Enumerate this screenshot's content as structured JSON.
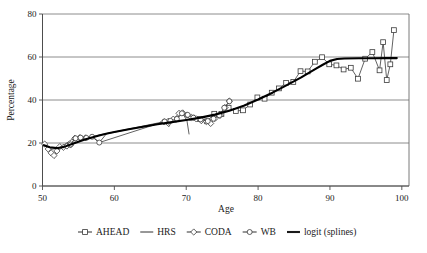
{
  "chart_data": {
    "type": "line",
    "title": "",
    "xlabel": "Age",
    "ylabel": "Percentage",
    "xlim": [
      50,
      101
    ],
    "ylim": [
      0,
      80
    ],
    "xticks": [
      50,
      60,
      70,
      80,
      90,
      100
    ],
    "yticks": [
      0,
      20,
      40,
      60,
      80
    ],
    "grid": "horizontal",
    "legend_position": "bottom-outside",
    "legend": [
      "AHEAD",
      "HRS",
      "CODA",
      "WB",
      "logit (splines)"
    ],
    "series": [
      {
        "name": "AHEAD",
        "marker": "square",
        "points": [
          [
            70.8,
            31.8
          ],
          [
            71.9,
            31.2
          ],
          [
            72.9,
            30.1
          ],
          [
            73.9,
            33.6
          ],
          [
            74.9,
            33.5
          ],
          [
            75.9,
            36.4
          ],
          [
            76.9,
            34.9
          ],
          [
            77.9,
            35.2
          ],
          [
            78.9,
            37.9
          ],
          [
            79.9,
            41.2
          ],
          [
            80.9,
            40.6
          ],
          [
            81.9,
            43.4
          ],
          [
            82.9,
            45.4
          ],
          [
            83.9,
            48.0
          ],
          [
            84.9,
            48.4
          ],
          [
            85.9,
            53.4
          ],
          [
            86.9,
            53.3
          ],
          [
            87.9,
            57.8
          ],
          [
            88.9,
            59.9
          ],
          [
            89.9,
            56.6
          ],
          [
            90.9,
            56.1
          ],
          [
            91.9,
            54.2
          ],
          [
            92.9,
            55.0
          ],
          [
            93.9,
            49.9
          ],
          [
            94.9,
            59.2
          ],
          [
            95.9,
            62.3
          ],
          [
            96.9,
            53.8
          ],
          [
            97.4,
            66.9
          ],
          [
            97.9,
            49.3
          ],
          [
            98.4,
            56.6
          ],
          [
            98.9,
            72.5
          ]
        ]
      },
      {
        "name": "HRS",
        "marker": "none",
        "points": [
          [
            50.3,
            19.8
          ],
          [
            51.2,
            17.0
          ],
          [
            52.1,
            17.6
          ],
          [
            53.0,
            19.1
          ],
          [
            54.0,
            21.5
          ],
          [
            55.0,
            22.0
          ],
          [
            56.0,
            22.4
          ],
          [
            57.0,
            23.0
          ],
          [
            57.9,
            20.2
          ],
          [
            58.9,
            24.3
          ],
          [
            66.9,
            29.6
          ],
          [
            67.6,
            27.6
          ],
          [
            68.1,
            30.9
          ],
          [
            68.6,
            29.6
          ],
          [
            69.1,
            33.6
          ],
          [
            69.6,
            33.2
          ],
          [
            70.1,
            30.4
          ],
          [
            70.4,
            24.0
          ]
        ]
      },
      {
        "name": "CODA",
        "marker": "diamond",
        "points": [
          [
            50.3,
            19.5
          ],
          [
            50.8,
            17.2
          ],
          [
            51.2,
            15.4
          ],
          [
            51.6,
            14.2
          ],
          [
            52.0,
            16.3
          ],
          [
            52.4,
            18.3
          ],
          [
            52.9,
            18.0
          ],
          [
            53.4,
            18.6
          ],
          [
            53.9,
            19.1
          ],
          [
            54.5,
            22.2
          ],
          [
            55.2,
            22.5
          ],
          [
            56.0,
            22.4
          ],
          [
            66.9,
            29.9
          ],
          [
            67.5,
            30.1
          ],
          [
            68.2,
            31.1
          ],
          [
            69.0,
            33.8
          ],
          [
            69.5,
            34.0
          ],
          [
            70.1,
            33.0
          ],
          [
            70.7,
            31.9
          ],
          [
            71.4,
            31.2
          ],
          [
            72.1,
            30.4
          ],
          [
            72.8,
            30.0
          ],
          [
            73.4,
            29.1
          ],
          [
            74.0,
            31.4
          ],
          [
            74.7,
            32.8
          ],
          [
            75.4,
            36.5
          ],
          [
            76.0,
            39.5
          ]
        ]
      },
      {
        "name": "WB",
        "marker": "circle",
        "points": [
          [
            53.9,
            19.3
          ],
          [
            54.6,
            22.2
          ],
          [
            55.3,
            22.5
          ],
          [
            56.1,
            22.4
          ],
          [
            56.9,
            22.9
          ],
          [
            57.9,
            20.2
          ],
          [
            67.0,
            30.0
          ],
          [
            67.8,
            30.3
          ],
          [
            68.7,
            31.2
          ],
          [
            69.4,
            33.8
          ],
          [
            70.2,
            33.1
          ],
          [
            71.0,
            31.8
          ],
          [
            72.0,
            31.0
          ],
          [
            73.0,
            30.2
          ],
          [
            73.8,
            31.3
          ],
          [
            74.6,
            32.9
          ],
          [
            75.3,
            36.4
          ],
          [
            76.0,
            39.4
          ]
        ]
      },
      {
        "name": "logit (splines)",
        "marker": "none",
        "points": [
          [
            50.2,
            19.0
          ],
          [
            51.0,
            18.0
          ],
          [
            52.0,
            17.6
          ],
          [
            53.0,
            18.2
          ],
          [
            54.0,
            19.4
          ],
          [
            55.0,
            20.6
          ],
          [
            56.0,
            21.7
          ],
          [
            57.0,
            22.7
          ],
          [
            58.0,
            23.6
          ],
          [
            59.0,
            24.4
          ],
          [
            60.0,
            25.1
          ],
          [
            62.0,
            26.4
          ],
          [
            64.0,
            27.6
          ],
          [
            66.0,
            28.7
          ],
          [
            68.0,
            29.7
          ],
          [
            70.0,
            30.7
          ],
          [
            72.0,
            31.8
          ],
          [
            74.0,
            33.2
          ],
          [
            76.0,
            35.0
          ],
          [
            78.0,
            37.3
          ],
          [
            80.0,
            40.2
          ],
          [
            82.0,
            43.4
          ],
          [
            84.0,
            46.9
          ],
          [
            86.0,
            50.5
          ],
          [
            88.0,
            54.5
          ],
          [
            89.0,
            56.4
          ],
          [
            90.0,
            58.2
          ],
          [
            91.0,
            59.1
          ],
          [
            92.0,
            59.3
          ],
          [
            94.0,
            59.4
          ],
          [
            96.0,
            59.4
          ],
          [
            98.0,
            59.5
          ],
          [
            99.3,
            59.5
          ]
        ]
      }
    ]
  },
  "axes": {
    "ylabel": "Percentage",
    "xlabel": "Age",
    "ytick_labels": [
      "0",
      "20",
      "40",
      "60",
      "80"
    ],
    "xtick_labels": [
      "50",
      "60",
      "70",
      "80",
      "90",
      "100"
    ]
  },
  "legend": {
    "items": [
      {
        "label": "AHEAD",
        "marker": "square",
        "has_line": true
      },
      {
        "label": "HRS",
        "marker": "none",
        "has_line": true
      },
      {
        "label": "CODA",
        "marker": "diamond",
        "has_line": true
      },
      {
        "label": "WB",
        "marker": "circle",
        "has_line": true
      },
      {
        "label": "logit (splines)",
        "marker": "none",
        "has_line": true
      }
    ]
  },
  "colors": {
    "background": "#ffffff",
    "grid": "#808080",
    "axis": "#4d4d4d",
    "series": "#3a3a3a",
    "logit": "#000000"
  }
}
